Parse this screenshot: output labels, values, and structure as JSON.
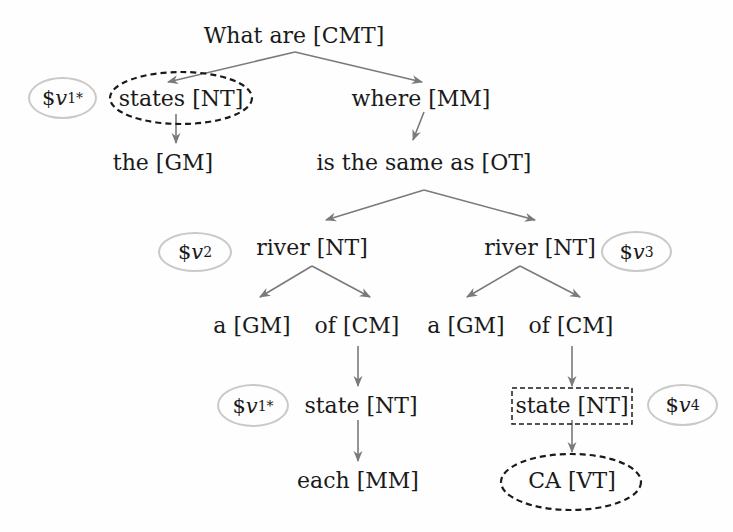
{
  "diagram": {
    "type": "query-parse-tree",
    "nodes": [
      {
        "id": "n0",
        "word": "What are",
        "tag": "[CMT]",
        "label": "What are [CMT]",
        "x": 294,
        "y": 36,
        "marker": "none"
      },
      {
        "id": "n1",
        "word": "states",
        "tag": "[NT]",
        "label": "states [NT]",
        "x": 181,
        "y": 99,
        "marker": "dashed-ellipse"
      },
      {
        "id": "n2",
        "word": "where",
        "tag": "[MM]",
        "label": "where [MM]",
        "x": 421,
        "y": 99,
        "marker": "none"
      },
      {
        "id": "n3",
        "word": "the",
        "tag": "[GM]",
        "label": "the [GM]",
        "x": 163,
        "y": 163,
        "marker": "none"
      },
      {
        "id": "n4",
        "word": "is the same as",
        "tag": "[OT]",
        "label": "is the same as [OT]",
        "x": 424,
        "y": 163,
        "marker": "none"
      },
      {
        "id": "n5",
        "word": "river",
        "tag": "[NT]",
        "label": "river [NT]",
        "x": 312,
        "y": 248,
        "marker": "none"
      },
      {
        "id": "n6",
        "word": "river",
        "tag": "[NT]",
        "label": "river [NT]",
        "x": 540,
        "y": 248,
        "marker": "none"
      },
      {
        "id": "n7",
        "word": "a",
        "tag": "[GM]",
        "label": "a [GM]",
        "x": 252,
        "y": 326,
        "marker": "none"
      },
      {
        "id": "n8",
        "word": "of",
        "tag": "[CM]",
        "label": "of [CM]",
        "x": 357,
        "y": 326,
        "marker": "none"
      },
      {
        "id": "n9",
        "word": "a",
        "tag": "[GM]",
        "label": "a [GM]",
        "x": 466,
        "y": 326,
        "marker": "none"
      },
      {
        "id": "n10",
        "word": "of",
        "tag": "[CM]",
        "label": "of [CM]",
        "x": 571,
        "y": 326,
        "marker": "none"
      },
      {
        "id": "n11",
        "word": "state",
        "tag": "[NT]",
        "label": "state [NT]",
        "x": 361,
        "y": 406,
        "marker": "none"
      },
      {
        "id": "n12",
        "word": "state",
        "tag": "[NT]",
        "label": "state [NT]",
        "x": 572,
        "y": 406,
        "marker": "dashed-rect"
      },
      {
        "id": "n13",
        "word": "each",
        "tag": "[MM]",
        "label": "each [MM]",
        "x": 358,
        "y": 481,
        "marker": "none"
      },
      {
        "id": "n14",
        "word": "CA",
        "tag": "[VT]",
        "label": "CA [VT]",
        "x": 572,
        "y": 481,
        "marker": "dashed-ellipse"
      }
    ],
    "edges": [
      {
        "from": "n0",
        "to": "n1",
        "x1": 295,
        "y1": 52,
        "x2": 168,
        "y2": 82
      },
      {
        "from": "n0",
        "to": "n2",
        "x1": 295,
        "y1": 52,
        "x2": 422,
        "y2": 82
      },
      {
        "from": "n1",
        "to": "n3",
        "x1": 176,
        "y1": 114,
        "x2": 176,
        "y2": 143
      },
      {
        "from": "n2",
        "to": "n4",
        "x1": 424,
        "y1": 112,
        "x2": 413,
        "y2": 140
      },
      {
        "from": "n4",
        "to": "n5",
        "x1": 424,
        "y1": 190,
        "x2": 326,
        "y2": 220
      },
      {
        "from": "n4",
        "to": "n6",
        "x1": 424,
        "y1": 190,
        "x2": 535,
        "y2": 220
      },
      {
        "from": "n5",
        "to": "n7",
        "x1": 312,
        "y1": 266,
        "x2": 260,
        "y2": 297
      },
      {
        "from": "n5",
        "to": "n8",
        "x1": 312,
        "y1": 266,
        "x2": 370,
        "y2": 297
      },
      {
        "from": "n6",
        "to": "n9",
        "x1": 520,
        "y1": 266,
        "x2": 467,
        "y2": 297
      },
      {
        "from": "n6",
        "to": "n10",
        "x1": 520,
        "y1": 266,
        "x2": 580,
        "y2": 297
      },
      {
        "from": "n8",
        "to": "n11",
        "x1": 358,
        "y1": 346,
        "x2": 358,
        "y2": 386
      },
      {
        "from": "n11",
        "to": "n13",
        "x1": 358,
        "y1": 420,
        "x2": 358,
        "y2": 461
      },
      {
        "from": "n10",
        "to": "n12",
        "x1": 572,
        "y1": 346,
        "x2": 572,
        "y2": 386
      },
      {
        "from": "n12",
        "to": "n14",
        "x1": 572,
        "y1": 420,
        "x2": 572,
        "y2": 452
      }
    ],
    "variables": [
      {
        "id": "v1a",
        "prefix": "$",
        "name": "v",
        "sub": "1",
        "sup": "*",
        "label": "$v1*",
        "attached_to": "n1",
        "left": 28,
        "top": 77,
        "width": 69,
        "height": 42
      },
      {
        "id": "v2",
        "prefix": "$",
        "name": "v",
        "sub": "2",
        "sup": "",
        "label": "$v2",
        "attached_to": "n5",
        "left": 158,
        "top": 232,
        "width": 74,
        "height": 40
      },
      {
        "id": "v3",
        "prefix": "$",
        "name": "v",
        "sub": "3",
        "sup": "",
        "label": "$v3",
        "attached_to": "n6",
        "left": 601,
        "top": 231,
        "width": 71,
        "height": 41
      },
      {
        "id": "v1b",
        "prefix": "$",
        "name": "v",
        "sub": "1",
        "sup": "*",
        "label": "$v1*",
        "attached_to": "n11",
        "left": 217,
        "top": 384,
        "width": 72,
        "height": 43
      },
      {
        "id": "v4",
        "prefix": "$",
        "name": "v",
        "sub": "4",
        "sup": "",
        "label": "$v4",
        "attached_to": "n12",
        "left": 647,
        "top": 384,
        "width": 71,
        "height": 42
      }
    ],
    "markers": {
      "dashed_ellipses": [
        {
          "node": "n1",
          "cx": 181,
          "cy": 98,
          "rx": 71,
          "ry": 26
        },
        {
          "node": "n14",
          "cx": 571,
          "cy": 482,
          "rx": 70,
          "ry": 28
        }
      ],
      "dashed_rects": [
        {
          "node": "n12",
          "x": 512,
          "y": 388,
          "w": 120,
          "h": 36
        }
      ]
    },
    "colors": {
      "text": "#1a1a1a",
      "edge": "#7a7a7a",
      "variable_border": "#c9c9c9",
      "marker_dash": "#1a1a1a",
      "background": "#fefefe"
    }
  }
}
